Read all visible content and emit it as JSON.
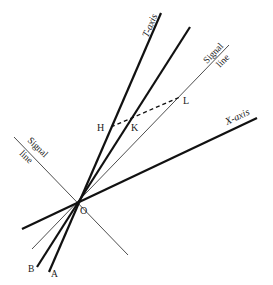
{
  "diagram": {
    "type": "spacetime-diagram",
    "colors": {
      "background": "#ffffff",
      "ink": "#1a1a1a"
    },
    "origin": {
      "label": "O",
      "x": 77,
      "y": 203
    },
    "lines": [
      {
        "id": "t-axis",
        "label": "T-axis",
        "x1": 49,
        "y1": 272,
        "x2": 161,
        "y2": 13,
        "weight": "thick"
      },
      {
        "id": "worldline-b",
        "label": "",
        "x1": 37,
        "y1": 267,
        "x2": 190,
        "y2": 27,
        "weight": "thick"
      },
      {
        "id": "signal-line-right",
        "label": "Signal line",
        "x1": 32,
        "y1": 249,
        "x2": 229,
        "y2": 45,
        "weight": "thin"
      },
      {
        "id": "x-axis",
        "label": "X-axis",
        "x1": 22,
        "y1": 229,
        "x2": 257,
        "y2": 118,
        "weight": "thick"
      },
      {
        "id": "signal-line-left",
        "label": "Signal line",
        "x1": 14,
        "y1": 137,
        "x2": 128,
        "y2": 255,
        "weight": "thin"
      }
    ],
    "dashed_segment": {
      "from": "H",
      "to": "L",
      "x1": 111,
      "y1": 127,
      "x2": 180,
      "y2": 97
    },
    "points": [
      {
        "label": "H",
        "x": 97,
        "y": 131
      },
      {
        "label": "K",
        "x": 131,
        "y": 131
      },
      {
        "label": "L",
        "x": 183,
        "y": 104
      },
      {
        "label": "O",
        "x": 80,
        "y": 214
      },
      {
        "label": "A",
        "x": 51,
        "y": 277
      },
      {
        "label": "B",
        "x": 28,
        "y": 272
      }
    ],
    "axis_labels": {
      "t_axis": "T-axis",
      "x_axis": "X-axis",
      "signal_line_right_1": "Signal",
      "signal_line_right_2": "line",
      "signal_line_left_1": "Signal",
      "signal_line_left_2": "line"
    }
  }
}
